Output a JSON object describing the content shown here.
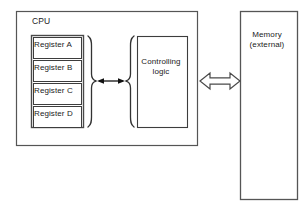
{
  "diagram": {
    "title_text_visible": false,
    "background_color": "#ffffff",
    "line_color": "#4d4d4d",
    "accent_color": "#1a1a1a",
    "cpu": {
      "label": "CPU",
      "registers": [
        {
          "label": "Register A"
        },
        {
          "label": "Register B"
        },
        {
          "label": "Register C"
        },
        {
          "label": "Register D"
        }
      ],
      "controlling_logic": {
        "label": "Controlling\nlogic",
        "line1": "Controlling",
        "line2": "logic"
      },
      "internal_bus_arrow": {
        "icon": "double-headed-arrow-icon",
        "direction": "bidirectional",
        "style": "solid"
      },
      "register_brace": {
        "icon": "right-curly-brace-icon"
      },
      "logic_brace": {
        "icon": "left-curly-brace-icon"
      }
    },
    "memory": {
      "line1": "Memory",
      "line2": "(external)"
    },
    "external_bus_arrow": {
      "icon": "hollow-double-headed-arrow-icon",
      "direction": "bidirectional",
      "style": "outlined"
    }
  }
}
